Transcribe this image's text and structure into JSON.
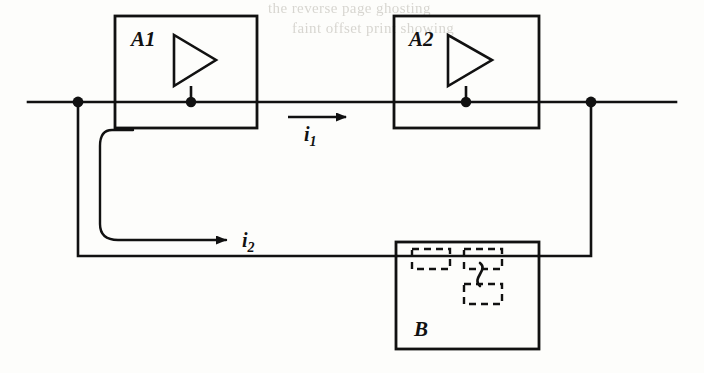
{
  "figure": {
    "type": "circuit-schematic",
    "width": 704,
    "height": 373,
    "ink_color": "#111111",
    "background_color": "#fdfdfb"
  },
  "blocks": [
    {
      "id": "A1",
      "label": "A1",
      "x": 115,
      "y": 16,
      "width": 142,
      "height": 112,
      "symbol": "amplifier-triangle"
    },
    {
      "id": "A2",
      "label": "A2",
      "x": 394,
      "y": 16,
      "width": 145,
      "height": 112,
      "symbol": "amplifier-triangle"
    },
    {
      "id": "B",
      "label": "B",
      "x": 396,
      "y": 242,
      "width": 143,
      "height": 107,
      "symbol": "dashed-network"
    }
  ],
  "currents": [
    {
      "id": "i1",
      "label": "i",
      "subscript": "1",
      "direction": "right",
      "arrow_x1": 288,
      "arrow_x2": 352,
      "arrow_y": 117,
      "label_x": 310,
      "label_y": 137
    },
    {
      "id": "i2",
      "label": "i",
      "subscript": "2",
      "direction": "right",
      "arrow_x1": 130,
      "arrow_x2": 232,
      "arrow_y": 240,
      "label_x": 243,
      "label_y": 240
    }
  ],
  "nodes": [
    {
      "id": "node-left",
      "cx": 78,
      "cy": 102,
      "r": 5
    },
    {
      "id": "node-right",
      "cx": 591,
      "cy": 103,
      "r": 5
    },
    {
      "id": "node-a1-output",
      "cx": 191,
      "cy": 102,
      "r": 5
    },
    {
      "id": "node-a2-output",
      "cx": 466,
      "cy": 102,
      "r": 5
    }
  ],
  "wires": {
    "main_line_y": 102,
    "main_line_x1": 28,
    "main_line_x2": 676,
    "feedback_bottom_y": 256,
    "feedback_left_x": 78,
    "feedback_right_x": 591
  },
  "bleed_through_text": [
    {
      "text": "the  reverse  page  ghosting",
      "x": 268,
      "y": 2
    },
    {
      "text": "faint  offset  print  showing",
      "x": 292,
      "y": 22
    }
  ]
}
